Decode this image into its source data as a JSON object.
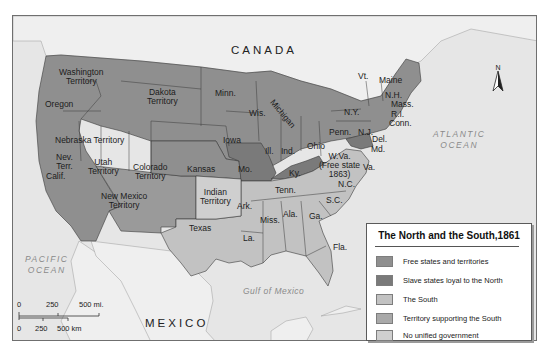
{
  "map": {
    "title": "The North and the South,1861",
    "colors": {
      "free": "#8f8f8f",
      "slave_loyal": "#7a7a7a",
      "south": "#c2c2c2",
      "territory_south": "#a9a9a9",
      "no_government": "#cfcfcf",
      "water": "#e6e6e6",
      "foreign_land": "#efefef"
    },
    "region_labels": {
      "canada": "CANADA",
      "mexico": "MEXICO",
      "pacific_1": "PACIFIC",
      "pacific_2": "OCEAN",
      "atlantic_1": "ATLANTIC",
      "atlantic_2": "OCEAN",
      "gulf": "Gulf of Mexico"
    },
    "state_labels": {
      "washington": "Washington\nTerritory",
      "oregon": "Oregon",
      "dakota": "Dakota\nTerritory",
      "minn": "Minn.",
      "wis": "Wis.",
      "michigan": "Michigan",
      "ny": "N.Y.",
      "vt": "Vt.",
      "maine": "Maine",
      "nh": "N.H.",
      "mass": "Mass.",
      "ri": "R.I.",
      "conn": "Conn.",
      "penn": "Penn.",
      "nj": "N.J.",
      "del": "Del.",
      "md": "Md.",
      "nev": "Nev.\nTerr.",
      "utah": "Utah\nTerritory",
      "nebraska": "Nebraska Territory",
      "iowa": "Iowa",
      "ill": "Ill.",
      "ind": "Ind.",
      "ohio": "Ohio",
      "wva": "W.Va.\n(Free state\n1863)",
      "va": "Va.",
      "colorado": "Colorado\nTerritory",
      "kansas": "Kansas",
      "mo": "Mo.",
      "ky": "Ky.",
      "calif": "Calif.",
      "tenn": "Tenn.",
      "nc": "N.C.",
      "new_mexico": "New Mexico\nTerritory",
      "indian": "Indian\nTerritory",
      "ark": "Ark.",
      "sc": "S.C.",
      "miss": "Miss.",
      "ala": "Ala.",
      "ga": "Ga.",
      "texas": "Texas",
      "la": "La.",
      "fla": "Fla."
    },
    "compass": {
      "label": "N",
      "icon": "north-arrow-icon"
    },
    "scale": {
      "miles_ticks": [
        "0",
        "250",
        "500 mi."
      ],
      "km_ticks": [
        "0",
        "250",
        "500 km"
      ]
    }
  },
  "legend": {
    "title": "The North and the South,1861",
    "items": [
      {
        "label": "Free states and territories",
        "color": "#8f8f8f"
      },
      {
        "label": "Slave states loyal to the North",
        "color": "#7a7a7a"
      },
      {
        "label": "The South",
        "color": "#c2c2c2"
      },
      {
        "label": "Territory supporting the South",
        "color": "#a9a9a9"
      },
      {
        "label": "No unified government",
        "color": "#cfcfcf"
      }
    ]
  }
}
